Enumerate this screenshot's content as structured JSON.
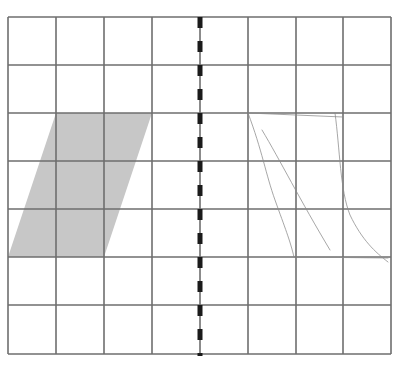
{
  "diagram": {
    "grid": {
      "columns": 8,
      "rows": 7,
      "x_lines": [
        8,
        56,
        104,
        152,
        200,
        248,
        296,
        343,
        391
      ],
      "y_lines": [
        17,
        65,
        113,
        161,
        209,
        257,
        305,
        354
      ],
      "line_color": "#6e6e6e",
      "line_width": 1.6
    },
    "mirror_line": {
      "x": 200,
      "y_start": 17,
      "y_end": 356,
      "dash": 11,
      "gap": 13,
      "color": "#1a1a1a",
      "width": 5
    },
    "shape": {
      "name": "parallelogram",
      "fill": "#c7c7c7",
      "points": [
        [
          56,
          113
        ],
        [
          152,
          113
        ],
        [
          104,
          257
        ],
        [
          8,
          257
        ]
      ]
    },
    "sketch": {
      "color": "#8a8a8a",
      "strokes": [
        "M248,113 L343,117",
        "M248,113 C262,150 266,175 275,200 C285,228 290,240 294,257",
        "M262,130 C280,160 300,200 330,250",
        "M335,113 C340,150 340,190 350,215 C362,240 375,252 388,262",
        "M294,257 L388,258"
      ]
    }
  }
}
